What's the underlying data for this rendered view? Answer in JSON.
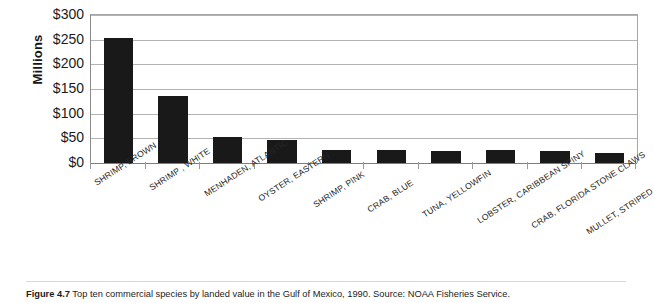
{
  "figure": {
    "caption_label": "Figure 4.7",
    "caption_text": "Top ten commercial species by landed value in the Gulf of Mexico, 1990. Source: NOAA Fisheries Service."
  },
  "axes": {
    "y_title": "Millions",
    "y_ticks": [
      "$300",
      "$250",
      "$200",
      "$150",
      "$100",
      "$50",
      "$0"
    ]
  },
  "chart_data": {
    "type": "bar",
    "title": "",
    "subtitle": "",
    "xlabel": "",
    "ylabel": "Millions",
    "ylim": [
      0,
      300
    ],
    "y_tick_values": [
      0,
      50,
      100,
      150,
      200,
      250,
      300
    ],
    "y_tick_labels": [
      "$0",
      "$50",
      "$100",
      "$150",
      "$200",
      "$250",
      "$300"
    ],
    "y_tick_prefix": "$",
    "grid": "horizontal",
    "legend": "none",
    "bar_color": "#191919",
    "units": "millions of US dollars (landed value)",
    "categories": [
      "SHRIMP, BROWN",
      "SHRIMP , WHITE",
      "MENHADEN, ATLANTIC",
      "OYSTER, EASTERN",
      "SHRIMP, PINK",
      "CRAB, BLUE",
      "TUNA, YELLOWFIN",
      "LOBSTER, CARIBBEAN SPINY",
      "CRAB, FLORIDA STONE CLAWS",
      "MULLET, STRIPED"
    ],
    "values": [
      253,
      135,
      52,
      47,
      27,
      26,
      25,
      26,
      24,
      20
    ],
    "annotations": []
  }
}
